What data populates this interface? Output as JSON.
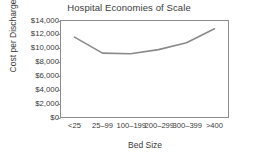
{
  "chart_data": {
    "type": "line",
    "title": "Hospital Economies of Scale",
    "xlabel": "Bed Size",
    "ylabel": "Cost per Discharge",
    "categories": [
      "<25",
      "25–99",
      "100–199",
      "200–299",
      "300–399",
      ">400"
    ],
    "values": [
      11600,
      9300,
      9200,
      9800,
      10800,
      12800
    ],
    "ylim": [
      0,
      14000
    ],
    "ytick_values": [
      14000,
      12000,
      10000,
      8000,
      6000,
      4000,
      2000,
      0
    ],
    "ytick_labels": [
      "$14,000",
      "$12,000",
      "$10,000",
      "$8,000",
      "$6,000",
      "$4,000",
      "$2,000",
      "$0"
    ],
    "grid": false,
    "legend": "none",
    "series_color": "#8a8a8a",
    "frame_color": "#8c8c8c",
    "background": "#ffffff"
  }
}
